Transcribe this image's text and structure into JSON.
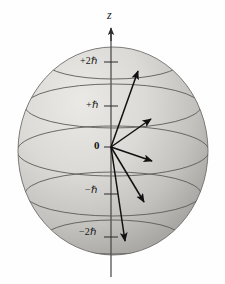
{
  "figure": {
    "type": "physics-vector-diagram",
    "width": 225,
    "height": 284,
    "background_color": "#fefefe",
    "sphere": {
      "center_x": 113,
      "center_y": 151,
      "radius_x": 95,
      "radius_y": 104,
      "fill_light": "#e6e4e1",
      "fill_mid": "#c9c7c3",
      "fill_dark": "#a7a5a1",
      "outline_color": "#6a6a68",
      "outline_width": 0.9
    },
    "axis": {
      "label": "z",
      "label_x": 107,
      "label_y": 10,
      "color": "#2b2b2b",
      "x": 111,
      "top_y": 27,
      "bottom_y": 277,
      "arrow_tip_y": 27
    },
    "ticks": [
      {
        "name": "plus-two-hbar",
        "text": "+2ℏ",
        "value": 2,
        "unit": "hbar",
        "label_x": 80,
        "label_y": 57,
        "ring_y": 62,
        "ring_rx": 68,
        "ring_ry": 17,
        "tick_x1": 105,
        "tick_x2": 117
      },
      {
        "name": "plus-one-hbar",
        "text": "+ℏ",
        "value": 1,
        "unit": "hbar",
        "label_x": 86,
        "label_y": 101,
        "ring_y": 106,
        "ring_rx": 88,
        "ring_ry": 22,
        "tick_x1": 105,
        "tick_x2": 117
      },
      {
        "name": "zero",
        "text": "0",
        "value": 0,
        "unit": "hbar",
        "label_x": 94,
        "label_y": 141,
        "ring_y": 151,
        "ring_rx": 96,
        "ring_ry": 25,
        "tick_x1": 104,
        "tick_x2": 112
      },
      {
        "name": "minus-one-hbar",
        "text": "−ℏ",
        "value": -1,
        "unit": "hbar",
        "label_x": 85,
        "label_y": 186,
        "ring_y": 194,
        "ring_rx": 88,
        "ring_ry": 22,
        "tick_x1": 105,
        "tick_x2": 117
      },
      {
        "name": "minus-two-hbar",
        "text": "−2ℏ",
        "value": -2,
        "unit": "hbar",
        "label_x": 79,
        "label_y": 228,
        "ring_y": 237,
        "ring_rx": 68,
        "ring_ry": 17,
        "tick_x1": 105,
        "tick_x2": 117
      }
    ],
    "vectors": {
      "origin_x": 111,
      "origin_y": 147,
      "color": "#111111",
      "stroke_width": 1.5,
      "items": [
        {
          "name": "vector-plus-two-hbar",
          "m_value": 2,
          "tip_x": 139,
          "tip_y": 69
        },
        {
          "name": "vector-plus-one-hbar",
          "m_value": 1,
          "tip_x": 153,
          "tip_y": 117
        },
        {
          "name": "vector-zero",
          "m_value": 0,
          "tip_x": 154,
          "tip_y": 163
        },
        {
          "name": "vector-minus-one-hbar",
          "m_value": -1,
          "tip_x": 146,
          "tip_y": 205
        },
        {
          "name": "vector-minus-two-hbar",
          "m_value": -2,
          "tip_x": 126,
          "tip_y": 245
        }
      ]
    }
  }
}
